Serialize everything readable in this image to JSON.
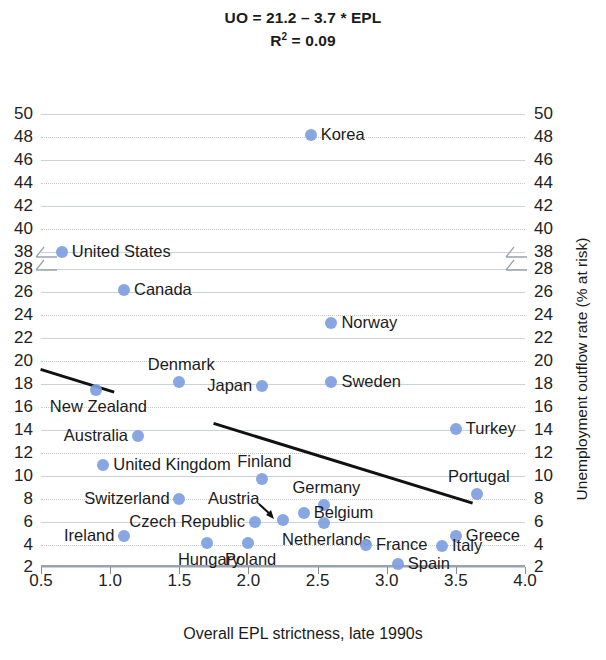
{
  "title": {
    "line1": "UO = 21.2 – 3.7 * EPL",
    "line2_prefix": "R",
    "line2_sup": "2",
    "line2_suffix": " = 0.09"
  },
  "axes": {
    "x_title": "Overall EPL strictness, late 1990s",
    "y_title": "Unemployment outflow rate (% at risk)",
    "x_ticks": [
      "0.5",
      "1.0",
      "1.5",
      "2.0",
      "2.5",
      "3.0",
      "3.5",
      "4.0"
    ],
    "y_ticks": [
      "2",
      "4",
      "6",
      "8",
      "10",
      "12",
      "14",
      "16",
      "18",
      "20",
      "22",
      "24",
      "26",
      "28",
      "38",
      "40",
      "42",
      "44",
      "46",
      "48",
      "50"
    ],
    "marker_color": "#7e9ee0",
    "trendline_color": "#111111",
    "gridline_color": "#c9d2dc"
  },
  "chart_data": {
    "type": "scatter",
    "xlabel": "Overall EPL strictness, late 1990s",
    "ylabel": "Unemployment outflow rate (% at risk)",
    "xlim": [
      0.5,
      4.0
    ],
    "ylim": [
      2,
      50
    ],
    "y_axis_break": [
      28,
      38
    ],
    "grid": true,
    "legend": "none",
    "regression": {
      "intercept": 21.2,
      "slope": -3.7,
      "r_squared": 0.09,
      "equation": "UO = 21.2 – 3.7 * EPL"
    },
    "points": [
      {
        "label": "Korea",
        "x": 2.45,
        "y": 48.2,
        "label_pos": "right"
      },
      {
        "label": "United States",
        "x": 0.65,
        "y": 38.0,
        "label_pos": "right"
      },
      {
        "label": "Canada",
        "x": 1.1,
        "y": 26.2,
        "label_pos": "right"
      },
      {
        "label": "Norway",
        "x": 2.6,
        "y": 23.3,
        "label_pos": "right"
      },
      {
        "label": "Denmark",
        "x": 1.5,
        "y": 18.2,
        "label_pos": "above"
      },
      {
        "label": "Sweden",
        "x": 2.6,
        "y": 18.2,
        "label_pos": "right"
      },
      {
        "label": "Japan",
        "x": 2.1,
        "y": 17.8,
        "label_pos": "left"
      },
      {
        "label": "New Zealand",
        "x": 0.9,
        "y": 17.5,
        "label_pos": "below"
      },
      {
        "label": "Turkey",
        "x": 3.5,
        "y": 14.1,
        "label_pos": "right"
      },
      {
        "label": "Australia",
        "x": 1.2,
        "y": 13.5,
        "label_pos": "left"
      },
      {
        "label": "United Kingdom",
        "x": 0.95,
        "y": 11.0,
        "label_pos": "right"
      },
      {
        "label": "Finland",
        "x": 2.1,
        "y": 9.7,
        "label_pos": "above"
      },
      {
        "label": "Portugal",
        "x": 3.65,
        "y": 8.4,
        "label_pos": "above"
      },
      {
        "label": "Switzerland",
        "x": 1.5,
        "y": 8.0,
        "label_pos": "left"
      },
      {
        "label": "Germany",
        "x": 2.55,
        "y": 7.5,
        "label_pos": "above"
      },
      {
        "label": "Belgium",
        "x": 2.4,
        "y": 6.8,
        "label_pos": "right"
      },
      {
        "label": "Austria",
        "x": 2.25,
        "y": 6.2,
        "label_pos": "arrow"
      },
      {
        "label": "Czech Republic",
        "x": 2.05,
        "y": 6.0,
        "label_pos": "left"
      },
      {
        "label": "Netherlands",
        "x": 2.55,
        "y": 5.9,
        "label_pos": "below"
      },
      {
        "label": "Greece",
        "x": 3.5,
        "y": 4.8,
        "label_pos": "right"
      },
      {
        "label": "Ireland",
        "x": 1.1,
        "y": 4.8,
        "label_pos": "left"
      },
      {
        "label": "Hungary",
        "x": 1.7,
        "y": 4.2,
        "label_pos": "below"
      },
      {
        "label": "Poland",
        "x": 2.0,
        "y": 4.2,
        "label_pos": "below"
      },
      {
        "label": "France",
        "x": 2.85,
        "y": 4.0,
        "label_pos": "right"
      },
      {
        "label": "Italy",
        "x": 3.4,
        "y": 3.9,
        "label_pos": "right"
      },
      {
        "label": "Spain",
        "x": 3.08,
        "y": 2.3,
        "label_pos": "right"
      }
    ]
  }
}
